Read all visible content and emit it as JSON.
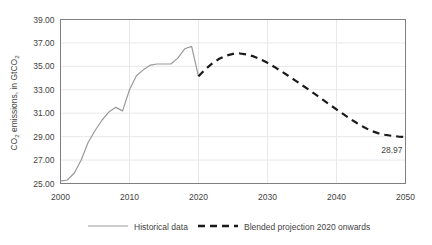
{
  "chart_data": {
    "type": "line",
    "title": "",
    "xlabel": "",
    "ylabel": "CO2 emissions, in GtCO2",
    "ylabel_parts": {
      "pre": "CO",
      "sub1": "2",
      "mid": " emissions, in GtCO",
      "sub2": "2"
    },
    "xlim": [
      2000,
      2050
    ],
    "ylim": [
      25.0,
      39.0
    ],
    "ytick_step": 2.0,
    "xtick_step": 10,
    "grid": true,
    "grid_axis": "y",
    "legend_position": "bottom",
    "y_ticks": [
      "25.00",
      "27.00",
      "29.00",
      "31.00",
      "33.00",
      "35.00",
      "37.00",
      "39.00"
    ],
    "y_tick_values": [
      25.0,
      27.0,
      29.0,
      31.0,
      33.0,
      35.0,
      37.0,
      39.0
    ],
    "x_ticks": [
      "2000",
      "2010",
      "2020",
      "2030",
      "2040",
      "2050"
    ],
    "x_tick_values": [
      2000,
      2010,
      2020,
      2030,
      2040,
      2050
    ],
    "annotations": [
      {
        "name": "endpoint-value",
        "text": "28.97",
        "x": 2050,
        "y": 28.97
      }
    ],
    "series": [
      {
        "name": "Historical data",
        "style": "solid",
        "color": "#9a9a9a",
        "width": 1.2,
        "x": [
          2000,
          2001,
          2002,
          2003,
          2004,
          2005,
          2006,
          2007,
          2008,
          2009,
          2010,
          2011,
          2012,
          2013,
          2014,
          2015,
          2016,
          2017,
          2018,
          2019,
          2020
        ],
        "values": [
          25.2,
          25.3,
          25.9,
          27.0,
          28.5,
          29.5,
          30.4,
          31.1,
          31.5,
          31.2,
          33.0,
          34.2,
          34.7,
          35.1,
          35.2,
          35.2,
          35.2,
          35.7,
          36.5,
          36.7,
          34.15
        ]
      },
      {
        "name": "Blended projection 2020 onwards",
        "style": "dashed",
        "color": "#1a1a1a",
        "width": 2.2,
        "x": [
          2020,
          2021,
          2022,
          2023,
          2024,
          2025,
          2026,
          2027,
          2028,
          2029,
          2030,
          2031,
          2032,
          2033,
          2034,
          2035,
          2036,
          2037,
          2038,
          2039,
          2040,
          2041,
          2042,
          2043,
          2044,
          2045,
          2046,
          2047,
          2048,
          2049,
          2050
        ],
        "values": [
          34.15,
          34.75,
          35.25,
          35.65,
          35.92,
          36.06,
          36.1,
          36.02,
          35.85,
          35.6,
          35.3,
          34.95,
          34.58,
          34.2,
          33.8,
          33.4,
          33.0,
          32.58,
          32.16,
          31.74,
          31.32,
          30.92,
          30.52,
          30.14,
          29.8,
          29.5,
          29.3,
          29.16,
          29.07,
          29.01,
          28.97
        ]
      }
    ]
  },
  "legend": {
    "items": [
      {
        "label": "Historical data",
        "style": "solid",
        "color": "#9a9a9a"
      },
      {
        "label": "Blended projection 2020 onwards",
        "style": "dashed",
        "color": "#1a1a1a"
      }
    ]
  },
  "colors": {
    "background": "#ffffff",
    "plot_border": "#7f7f7f",
    "gridline": "#e8e8e8",
    "text": "#3f3f3f",
    "historical": "#9a9a9a",
    "projection": "#1a1a1a"
  }
}
